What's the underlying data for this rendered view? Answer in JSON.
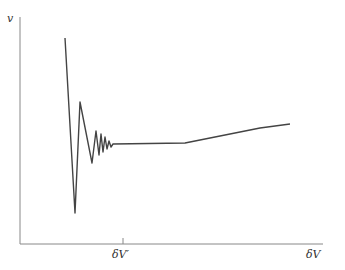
{
  "diagram": {
    "y_axis_label": "v",
    "x_tick_label": "δV′",
    "x_axis_label": "δV",
    "colors": {
      "axis": "#777777",
      "curve": "#444444"
    },
    "curve_points": "65,38 75,213 80,102 92,163 96,131 99,155 101,134 103,152 105,137 107,149 109,141 111,147 113,144 185,143 220,136 260,128 290,124"
  }
}
